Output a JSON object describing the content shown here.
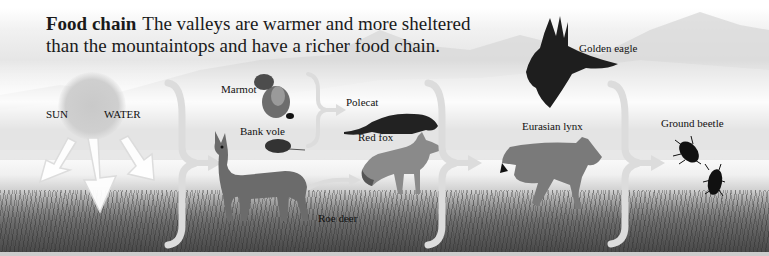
{
  "figure": {
    "title_bold": "Food chain",
    "title_text": "The valleys are warmer and more sheltered than the mountaintops and have a richer food chain.",
    "title_line1": "The valleys are warmer and more sheltered",
    "title_line2": "than the mountaintops and have a richer food chain."
  },
  "sources": {
    "sun": "SUN",
    "water": "WATER"
  },
  "organisms": {
    "marmot": "Marmot",
    "bank_vole": "Bank vole",
    "roe_deer": "Roe deer",
    "polecat": "Polecat",
    "red_fox": "Red fox",
    "golden_eagle": "Golden eagle",
    "eurasian_lynx": "Eurasian lynx",
    "ground_beetle": "Ground beetle"
  },
  "levels": [
    {
      "stage": 1,
      "members": [
        "SUN",
        "WATER"
      ]
    },
    {
      "stage": 2,
      "members": [
        "Marmot",
        "Bank vole",
        "Roe deer"
      ]
    },
    {
      "stage": 3,
      "members": [
        "Polecat",
        "Red fox"
      ]
    },
    {
      "stage": 4,
      "members": [
        "Golden eagle",
        "Eurasian lynx"
      ]
    },
    {
      "stage": 5,
      "members": [
        "Ground beetle"
      ]
    }
  ],
  "colors": {
    "background": "#ffffff",
    "arrow": "#dcdcdc",
    "text": "#111111",
    "grass": "#6e6e6e"
  }
}
